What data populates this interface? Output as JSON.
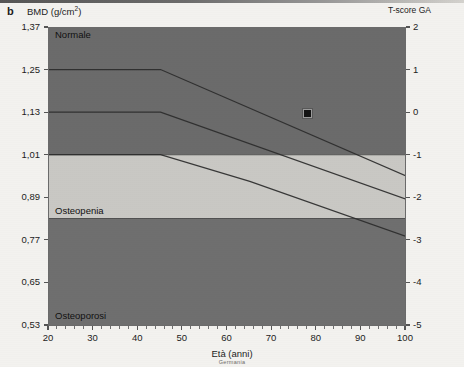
{
  "figure": {
    "panel_letter": "b",
    "y_axis_title": "BMD (g/cm",
    "y_axis_title_sup": "2",
    "y_axis_title_close": ")",
    "right_axis_title": "T-score GA",
    "x_axis_title": "Età (anni)",
    "x_axis_subtitle": "Germania"
  },
  "colors": {
    "normal_band": "#6b6b6b",
    "osteopenia_band": "#c9c8c4",
    "osteoporosis_band": "#6f6f6f",
    "reference_line": "#2b2b2b",
    "axis": "#6b6b6b",
    "marker_fill": "#141414",
    "marker_edge": "#9a9a9a",
    "page_background": "#f3f2ef"
  },
  "band_labels": [
    {
      "name": "normale",
      "text": "Normale"
    },
    {
      "name": "osteopenia",
      "text": "Osteopenia"
    },
    {
      "name": "osteoporosi",
      "text": "Osteoporosi"
    }
  ],
  "chart_data": {
    "type": "area",
    "title": "BMD (g/cm2)",
    "xlabel": "Età (anni)",
    "ylabel": "BMD (g/cm2)",
    "y2label": "T-score GA",
    "subtitle": "Germania",
    "xlim": [
      20,
      100
    ],
    "ylim": [
      0.53,
      1.37
    ],
    "y2lim": [
      -5,
      2
    ],
    "grid": false,
    "legend": "none",
    "x_ticks": [
      20,
      30,
      40,
      50,
      60,
      70,
      80,
      90,
      100
    ],
    "x_tick_labels": [
      "20",
      "30",
      "40",
      "50",
      "60",
      "70",
      "80",
      "90",
      "100"
    ],
    "y_ticks": [
      0.53,
      0.65,
      0.77,
      0.89,
      1.01,
      1.13,
      1.25,
      1.37
    ],
    "y_tick_labels": [
      "0,53",
      "0,65",
      "0,77",
      "0,89",
      "1,01",
      "1,13",
      "1,25",
      "1,37"
    ],
    "y2_ticks": [
      2,
      1,
      0,
      -1,
      -2,
      -3,
      -4,
      -5
    ],
    "y2_tick_labels": [
      "2",
      "1",
      "0",
      "-1",
      "-2",
      "-3",
      "-4",
      "-5"
    ],
    "bands": [
      {
        "name": "Normale",
        "color": "#6b6b6b",
        "t_score_range": [
          -1,
          2
        ],
        "description": "Dark band above the T-score -1 diagnostic threshold"
      },
      {
        "name": "Osteopenia",
        "color": "#c9c8c4",
        "t_score_range": [
          -2.5,
          -1
        ],
        "description": "Light band between T-score -1 and -2.5"
      },
      {
        "name": "Osteoporosi",
        "color": "#6f6f6f",
        "t_score_range": [
          -5,
          -2.5
        ],
        "description": "Dark band below the T-score -2.5 diagnostic threshold"
      }
    ],
    "series": [
      {
        "name": "percentile_upper",
        "comment": "Upper reference curve, flat then declining after age 45",
        "x": [
          20,
          45,
          100
        ],
        "y": [
          1.25,
          1.25,
          0.95
        ],
        "t_score": [
          1.0,
          1.0,
          -1.5
        ]
      },
      {
        "name": "percentile_mean",
        "comment": "Mean reference curve, flat then declining after age 45",
        "x": [
          20,
          45,
          100
        ],
        "y": [
          1.13,
          1.13,
          0.885
        ],
        "t_score": [
          0.0,
          0.0,
          -2.05
        ]
      },
      {
        "name": "percentile_lower",
        "comment": "Lower reference curve, flat then declining after age 65",
        "x": [
          20,
          45,
          65,
          100
        ],
        "y": [
          1.01,
          1.01,
          0.935,
          0.78
        ],
        "t_score": [
          -1.0,
          -1.0,
          -1.55,
          -2.9
        ]
      }
    ],
    "points": [
      {
        "name": "patient-measurement",
        "x": 78,
        "y": 1.125,
        "t_score": 0.0,
        "marker": "square",
        "color": "#141414"
      }
    ],
    "annotations": [
      {
        "text": "Normale",
        "x": 22,
        "y": 1.345
      },
      {
        "text": "Osteopenia",
        "x": 22,
        "y": 0.855
      },
      {
        "text": "Osteoporosi",
        "x": 22,
        "y": 0.552
      }
    ]
  }
}
